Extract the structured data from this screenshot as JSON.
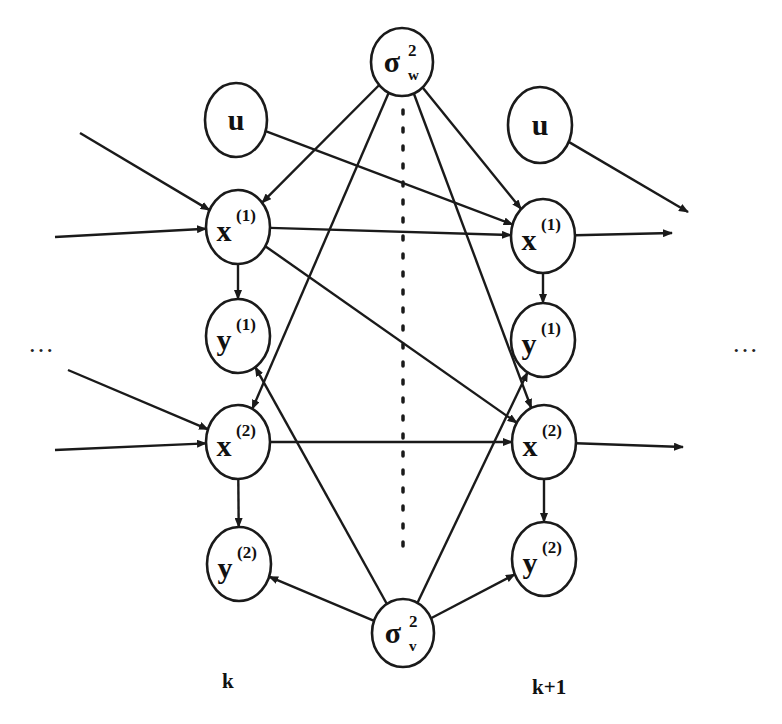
{
  "diagram": {
    "type": "dynamic bayesian network",
    "nodes": [
      {
        "id": "sigma_w",
        "symbol": "σ",
        "sup": "2",
        "sub": "w",
        "cx": 402,
        "cy": 62,
        "rx": 31,
        "ry": 34
      },
      {
        "id": "u_k",
        "symbol": "u",
        "sup": "",
        "sub": "",
        "cx": 236,
        "cy": 120,
        "rx": 31,
        "ry": 37
      },
      {
        "id": "u_k1",
        "symbol": "u",
        "sup": "",
        "sub": "",
        "cx": 540,
        "cy": 125,
        "rx": 32,
        "ry": 38
      },
      {
        "id": "x1_k",
        "symbol": "x",
        "sup": "(1)",
        "sub": "",
        "cx": 238,
        "cy": 227,
        "rx": 32,
        "ry": 37
      },
      {
        "id": "x1_k1",
        "symbol": "x",
        "sup": "(1)",
        "sub": "",
        "cx": 543,
        "cy": 236,
        "rx": 32,
        "ry": 37
      },
      {
        "id": "y1_k",
        "symbol": "y",
        "sup": "(1)",
        "sub": "",
        "cx": 238,
        "cy": 336,
        "rx": 32,
        "ry": 37
      },
      {
        "id": "y1_k1",
        "symbol": "y",
        "sup": "(1)",
        "sub": "",
        "cx": 543,
        "cy": 340,
        "rx": 32,
        "ry": 37
      },
      {
        "id": "x2_k",
        "symbol": "x",
        "sup": "(2)",
        "sub": "",
        "cx": 238,
        "cy": 442,
        "rx": 32,
        "ry": 37
      },
      {
        "id": "x2_k1",
        "symbol": "x",
        "sup": "(2)",
        "sub": "",
        "cx": 544,
        "cy": 442,
        "rx": 32,
        "ry": 37
      },
      {
        "id": "y2_k",
        "symbol": "y",
        "sup": "(2)",
        "sub": "",
        "cx": 239,
        "cy": 564,
        "rx": 32,
        "ry": 37
      },
      {
        "id": "y2_k1",
        "symbol": "y",
        "sup": "(2)",
        "sub": "",
        "cx": 544,
        "cy": 559,
        "rx": 32,
        "ry": 37
      },
      {
        "id": "sigma_v",
        "symbol": "σ",
        "sup": "2",
        "sub": "v",
        "cx": 403,
        "cy": 633,
        "rx": 31,
        "ry": 34
      }
    ],
    "edges": [
      {
        "from": "u_k",
        "to": "x1_k1"
      },
      {
        "from": "sigma_w",
        "to": "x1_k"
      },
      {
        "from": "sigma_w",
        "to": "x2_k"
      },
      {
        "from": "sigma_w",
        "to": "x1_k1"
      },
      {
        "from": "sigma_w",
        "to": "x2_k1"
      },
      {
        "from": "x1_k",
        "to": "x1_k1"
      },
      {
        "from": "x1_k",
        "to": "x2_k1"
      },
      {
        "from": "x2_k",
        "to": "x2_k1"
      },
      {
        "from": "x1_k",
        "to": "y1_k"
      },
      {
        "from": "x2_k",
        "to": "y2_k"
      },
      {
        "from": "x1_k1",
        "to": "y1_k1"
      },
      {
        "from": "x2_k1",
        "to": "y2_k1"
      },
      {
        "from": "sigma_v",
        "to": "y1_k"
      },
      {
        "from": "sigma_v",
        "to": "y2_k"
      },
      {
        "from": "sigma_v",
        "to": "y1_k1"
      },
      {
        "from": "sigma_v",
        "to": "y2_k1"
      },
      {
        "from": "external_left_1",
        "to": "x1_k"
      },
      {
        "from": "external_left_2",
        "to": "x1_k"
      },
      {
        "from": "external_left_3",
        "to": "x2_k"
      },
      {
        "from": "external_left_4",
        "to": "x2_k"
      },
      {
        "from": "u_k1",
        "to": "external_right_1"
      },
      {
        "from": "x1_k1",
        "to": "external_right_2"
      },
      {
        "from": "x2_k1",
        "to": "external_right_3"
      }
    ],
    "time_labels": [
      {
        "text": "k",
        "x": 229,
        "y": 688
      },
      {
        "text": "k+1",
        "x": 550,
        "y": 694
      }
    ],
    "ellipsis_left": "…",
    "ellipsis_right": "…",
    "colors": {
      "stroke": "#1a1a1a",
      "background": "#ffffff"
    }
  }
}
